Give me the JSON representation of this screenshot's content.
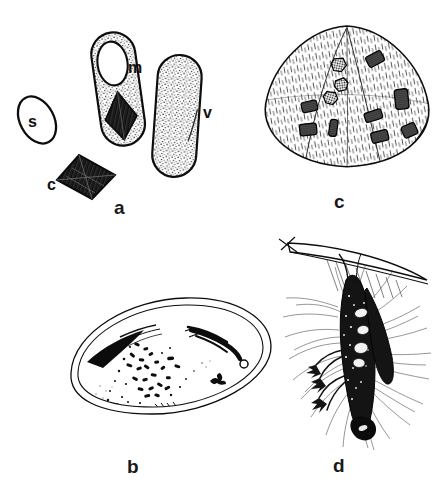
{
  "figure": {
    "background_color": "#ffffff",
    "ink_color": "#0d0d0d",
    "width": 446,
    "height": 491
  },
  "panels": [
    {
      "id": "a",
      "label": "a",
      "label_x": 114,
      "label_y": 198,
      "caption": "Bacterial spore, parasporal crystal, sporulating cell and vegetative rod",
      "structures": [
        {
          "key": "s",
          "label": "s",
          "label_x": 28,
          "label_y": 114,
          "name": "spore",
          "shape": "outlined-ellipse",
          "fill": "none"
        },
        {
          "key": "m",
          "label": "m",
          "label_x": 128,
          "label_y": 60,
          "name": "sporulating-cell",
          "shape": "stippled-capsule-with-spore-and-crystal",
          "fill": "stipple"
        },
        {
          "key": "c",
          "label": "c",
          "label_x": 47,
          "label_y": 177,
          "name": "parasporal-crystal",
          "shape": "dark-rhombus",
          "fill": "solid-hatched"
        },
        {
          "key": "v",
          "label": "v",
          "label_x": 203,
          "label_y": 105,
          "name": "vegetative-rod",
          "shape": "stippled-rod",
          "fill": "stipple"
        }
      ]
    },
    {
      "id": "c",
      "label": "c",
      "label_x": 334,
      "label_y": 192,
      "caption": "Hatched cell body containing crystalline inclusions",
      "inclusion_count": 11,
      "inclusions": [
        {
          "cx": 196,
          "cy": 62,
          "w": 20,
          "h": 14,
          "rot": -28,
          "kind": "striated-rect"
        },
        {
          "cx": 137,
          "cy": 72,
          "w": 15,
          "h": 14,
          "rot": 12,
          "kind": "hex-mesh"
        },
        {
          "cx": 141,
          "cy": 104,
          "w": 14,
          "h": 12,
          "rot": -8,
          "kind": "hex-mesh"
        },
        {
          "cx": 124,
          "cy": 126,
          "w": 15,
          "h": 13,
          "rot": 18,
          "kind": "hex-mesh"
        },
        {
          "cx": 88,
          "cy": 140,
          "w": 18,
          "h": 13,
          "rot": -12,
          "kind": "striated-rect"
        },
        {
          "cx": 86,
          "cy": 178,
          "w": 18,
          "h": 14,
          "rot": -6,
          "kind": "striated-rect"
        },
        {
          "cx": 128,
          "cy": 176,
          "w": 9,
          "h": 19,
          "rot": 8,
          "kind": "striated-rect"
        },
        {
          "cx": 193,
          "cy": 156,
          "w": 20,
          "h": 11,
          "rot": -18,
          "kind": "striated-rect"
        },
        {
          "cx": 240,
          "cy": 128,
          "w": 15,
          "h": 23,
          "rot": -6,
          "kind": "striated-rect"
        },
        {
          "cx": 204,
          "cy": 190,
          "w": 19,
          "h": 13,
          "rot": -14,
          "kind": "striated-rect"
        },
        {
          "cx": 253,
          "cy": 180,
          "w": 16,
          "h": 14,
          "rot": -24,
          "kind": "striated-rect"
        }
      ]
    },
    {
      "id": "b",
      "label": "b",
      "label_x": 127,
      "label_y": 457,
      "caption": "Infected host cell in section with rod-shaped bacilli and inclusion"
    },
    {
      "id": "d",
      "label": "d",
      "label_x": 333,
      "label_y": 456,
      "caption": "Dead infected insect hanging from a grass blade with radiating hyphae"
    }
  ]
}
